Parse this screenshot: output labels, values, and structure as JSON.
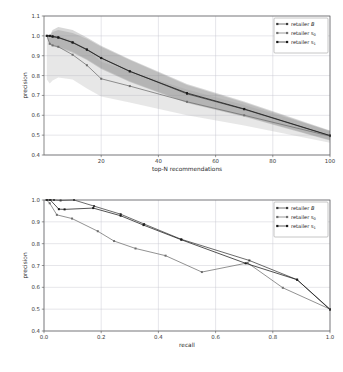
{
  "figure": {
    "background_color": "#ffffff",
    "panel_count": 2
  },
  "legend": {
    "position": "upper-right",
    "entries": [
      {
        "label_prefix": "retailer ",
        "label_symbol": "B",
        "style": "italic",
        "color": "#3a3a3a",
        "marker": "square"
      },
      {
        "label_prefix": "retailer ",
        "label_symbol": "s",
        "label_sub": "0",
        "style": "roman",
        "color": "#6e6e6e",
        "marker": "square"
      },
      {
        "label_prefix": "retailer ",
        "label_symbol": "s",
        "label_sub": "1",
        "style": "roman",
        "color": "#1a1a1a",
        "marker": "square"
      }
    ]
  },
  "chart_data": [
    {
      "type": "line",
      "id": "precision-vs-topn",
      "title": "",
      "xlabel": "top-N recommendations",
      "ylabel": "precision",
      "xlim": [
        0,
        100
      ],
      "ylim": [
        0.4,
        1.1
      ],
      "xticks": [
        20,
        40,
        60,
        80,
        100
      ],
      "xticklabels": [
        "20",
        "40",
        "60",
        "80",
        "100"
      ],
      "yticks": [
        0.4,
        0.5,
        0.6,
        0.7,
        0.8,
        0.9,
        1.0,
        1.1
      ],
      "yticklabels": [
        "0.4",
        "0.5",
        "0.6",
        "0.7",
        "0.8",
        "0.9",
        "1.0",
        "1.1"
      ],
      "grid": true,
      "legend": true,
      "x": [
        1,
        2,
        3,
        5,
        10,
        15,
        20,
        30,
        50,
        70,
        100
      ],
      "series": [
        {
          "name": "retailer B",
          "color": "#3a3a3a",
          "values": [
            1.0,
            1.0,
            0.995,
            0.99,
            0.968,
            0.932,
            0.889,
            0.822,
            0.708,
            0.63,
            0.497
          ],
          "band_upper": [
            1.0,
            1.0,
            1.02,
            1.03,
            1.015,
            0.985,
            0.945,
            0.878,
            0.752,
            0.664,
            0.52
          ],
          "band_lower": [
            1.0,
            0.96,
            0.955,
            0.945,
            0.92,
            0.882,
            0.838,
            0.772,
            0.665,
            0.596,
            0.475
          ],
          "band_color": "#8f8f8f",
          "band_opacity": 0.3
        },
        {
          "name": "retailer s0",
          "color": "#6e6e6e",
          "values": [
            1.0,
            0.96,
            0.952,
            0.945,
            0.905,
            0.852,
            0.784,
            0.747,
            0.668,
            0.6,
            0.495
          ],
          "band_upper": [
            1.0,
            1.0,
            1.0,
            1.0,
            0.975,
            0.93,
            0.87,
            0.822,
            0.73,
            0.652,
            0.522
          ],
          "band_lower": [
            0.78,
            0.76,
            0.775,
            0.79,
            0.78,
            0.735,
            0.695,
            0.665,
            0.6,
            0.548,
            0.462
          ],
          "band_color": "#b0b0b0",
          "band_opacity": 0.3
        },
        {
          "name": "retailer s1",
          "color": "#1a1a1a",
          "values": [
            1.0,
            1.0,
            0.998,
            0.993,
            0.966,
            0.93,
            0.888,
            0.821,
            0.712,
            0.632,
            0.498
          ],
          "band_upper": [
            1.0,
            1.0,
            1.03,
            1.045,
            1.03,
            0.992,
            0.95,
            0.882,
            0.758,
            0.67,
            0.523
          ],
          "band_lower": [
            1.0,
            0.955,
            0.948,
            0.94,
            0.915,
            0.878,
            0.833,
            0.768,
            0.662,
            0.592,
            0.473
          ],
          "band_color": "#707070",
          "band_opacity": 0.28
        }
      ]
    },
    {
      "type": "line",
      "id": "precision-recall",
      "title": "",
      "xlabel": "recall",
      "ylabel": "precision",
      "xlim": [
        0.0,
        1.0
      ],
      "ylim": [
        0.4,
        1.0
      ],
      "xticks": [
        0.0,
        0.2,
        0.4,
        0.6,
        0.8,
        1.0
      ],
      "xticklabels": [
        "0.0",
        "0.2",
        "0.4",
        "0.6",
        "0.8",
        "1.0"
      ],
      "yticks": [
        0.4,
        0.5,
        0.6,
        0.7,
        0.8,
        0.9,
        1.0
      ],
      "yticklabels": [
        "0.4",
        "0.5",
        "0.6",
        "0.7",
        "0.8",
        "0.9",
        "1.0"
      ],
      "grid": true,
      "legend": true,
      "series": [
        {
          "name": "retailer B",
          "color": "#3a3a3a",
          "points": [
            [
              0.01,
              1.0
            ],
            [
              0.022,
              1.0
            ],
            [
              0.035,
              1.0
            ],
            [
              0.058,
              0.998
            ],
            [
              0.105,
              1.0
            ],
            [
              0.175,
              0.972
            ],
            [
              0.268,
              0.935
            ],
            [
              0.35,
              0.89
            ],
            [
              0.48,
              0.82
            ],
            [
              0.718,
              0.723
            ],
            [
              0.885,
              0.635
            ],
            [
              1.0,
              0.5
            ]
          ]
        },
        {
          "name": "retailer s0",
          "color": "#6e6e6e",
          "points": [
            [
              0.009,
              1.0
            ],
            [
              0.02,
              0.985
            ],
            [
              0.045,
              0.932
            ],
            [
              0.098,
              0.915
            ],
            [
              0.188,
              0.857
            ],
            [
              0.245,
              0.812
            ],
            [
              0.32,
              0.778
            ],
            [
              0.425,
              0.745
            ],
            [
              0.552,
              0.67
            ],
            [
              0.712,
              0.712
            ],
            [
              0.835,
              0.598
            ],
            [
              1.0,
              0.5
            ]
          ]
        },
        {
          "name": "retailer s1",
          "color": "#1a1a1a",
          "points": [
            [
              0.01,
              1.0
            ],
            [
              0.022,
              1.0
            ],
            [
              0.052,
              0.958
            ],
            [
              0.072,
              0.957
            ],
            [
              0.172,
              0.963
            ],
            [
              0.268,
              0.928
            ],
            [
              0.348,
              0.885
            ],
            [
              0.48,
              0.818
            ],
            [
              0.705,
              0.71
            ],
            [
              0.885,
              0.635
            ],
            [
              1.0,
              0.498
            ]
          ]
        }
      ]
    }
  ]
}
